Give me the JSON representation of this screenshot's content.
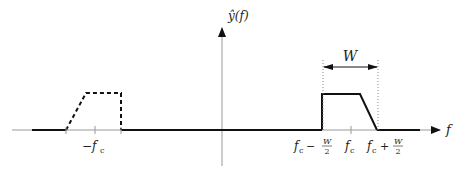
{
  "diagram": {
    "axes": {
      "x_label": "f",
      "y_label": "ŷ(f)"
    },
    "ticks": {
      "neg_fc": "−f",
      "neg_fc_sub": "c",
      "fc": "f",
      "fc_sub": "c",
      "fc_minus_w2": {
        "prefix": "f",
        "sub": "c",
        "op": "−",
        "num": "W",
        "den": "2"
      },
      "fc_plus_w2": {
        "prefix": "f",
        "sub": "c",
        "op": "+",
        "num": "W",
        "den": "2"
      }
    },
    "bandwidth_label": "W",
    "colors": {
      "line": "#111111",
      "axis": "#888888",
      "text": "#222222"
    }
  }
}
